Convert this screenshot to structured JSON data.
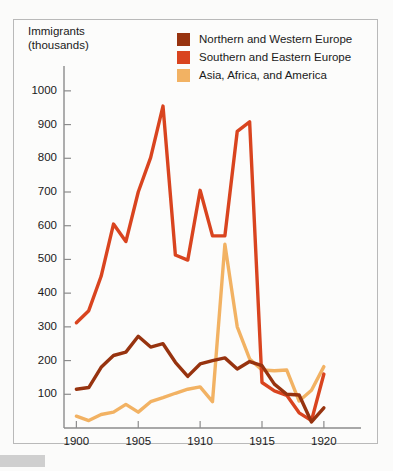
{
  "figure": {
    "background_color": "#fbfbfa",
    "frame_color": "#b9b9b9",
    "corner_tab_color": "#cfcfcf"
  },
  "axis_title": "Immigrants\n(thousands)",
  "legend": {
    "items": [
      {
        "label": "Northern and Western Europe",
        "color": "#97330f"
      },
      {
        "label": "Southern and Eastern Europe",
        "color": "#d9441f"
      },
      {
        "label": "Asia, Africa, and America",
        "color": "#f2b263"
      }
    ]
  },
  "chart_data": {
    "type": "line",
    "title": "",
    "subtitle": "",
    "xlabel": "",
    "ylabel": "Immigrants (thousands)",
    "xlim": [
      1899,
      1923
    ],
    "ylim": [
      0,
      1050
    ],
    "grid": false,
    "legend_position": "top-right",
    "x_ticks": [
      1900,
      1905,
      1910,
      1915,
      1920
    ],
    "x_tick_labels": [
      "1900",
      "1905",
      "1910",
      "1915",
      "1920"
    ],
    "y_ticks": [
      100,
      200,
      300,
      400,
      500,
      600,
      700,
      800,
      900,
      1000
    ],
    "y_tick_labels": [
      "100",
      "200",
      "300",
      "400",
      "500",
      "600",
      "700",
      "800",
      "900",
      "1000"
    ],
    "x": [
      1900,
      1901,
      1902,
      1903,
      1904,
      1905,
      1906,
      1907,
      1908,
      1909,
      1910,
      1911,
      1912,
      1913,
      1914,
      1915,
      1916,
      1917,
      1918,
      1919,
      1920
    ],
    "series": [
      {
        "name": "Northern and Western Europe",
        "color": "#97330f",
        "values": [
          115,
          120,
          180,
          215,
          225,
          272,
          240,
          250,
          195,
          153,
          190,
          200,
          208,
          175,
          197,
          185,
          130,
          100,
          98,
          18,
          60
        ]
      },
      {
        "name": "Southern and Eastern Europe",
        "color": "#d9441f",
        "values": [
          312,
          348,
          450,
          605,
          553,
          700,
          802,
          955,
          513,
          498,
          705,
          570,
          570,
          880,
          908,
          135,
          110,
          97,
          45,
          22,
          160
        ]
      },
      {
        "name": "Asia, Africa, and America",
        "color": "#f2b263",
        "values": [
          35,
          22,
          40,
          47,
          70,
          47,
          78,
          90,
          103,
          115,
          122,
          78,
          545,
          300,
          205,
          172,
          170,
          172,
          80,
          112,
          182
        ]
      }
    ]
  }
}
